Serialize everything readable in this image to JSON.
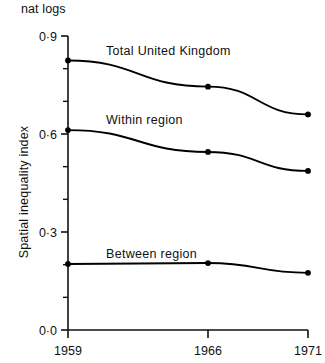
{
  "units_label": "nat\nlogs",
  "chart_data": {
    "type": "line",
    "title": "",
    "xlabel": "",
    "ylabel": "Spatial inequality index",
    "units": "nat logs",
    "categories": [
      "1959",
      "1966",
      "1971"
    ],
    "x": [
      1959,
      1966,
      1971
    ],
    "xlim": [
      1959,
      1971
    ],
    "ylim": [
      0.0,
      0.9
    ],
    "yticks": [
      0.0,
      0.3,
      0.6,
      0.9
    ],
    "ytick_labels": [
      "0·0",
      "0·3",
      "0·6",
      "0·9"
    ],
    "yticks_minor": [
      0.1,
      0.2,
      0.4,
      0.5,
      0.7,
      0.8
    ],
    "xtick_labels": [
      "1959",
      "1966",
      "1971"
    ],
    "grid": false,
    "legend": "inline-labels",
    "marker": "filled-circle",
    "line_color": "#000000",
    "series": [
      {
        "name": "Total United Kingdom",
        "label": "Total United Kingdom",
        "values": [
          0.825,
          0.745,
          0.66
        ]
      },
      {
        "name": "Within region",
        "label": "Within region",
        "values": [
          0.612,
          0.545,
          0.487
        ]
      },
      {
        "name": "Between region",
        "label": "Between region",
        "values": [
          0.202,
          0.205,
          0.175
        ]
      }
    ]
  }
}
